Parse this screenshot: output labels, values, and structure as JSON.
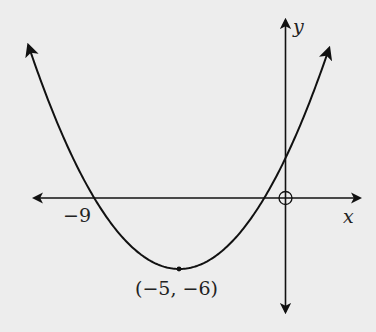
{
  "chart_data": {
    "type": "line",
    "title": "",
    "function": "y = 0.375(x + 5)^2 - 6",
    "xlabel": "x",
    "ylabel": "y",
    "vertex": {
      "x": -5,
      "y": -6,
      "label": "(−5, −6)"
    },
    "x_intercepts": [
      {
        "x": -9,
        "label": "−9"
      },
      {
        "x": -1,
        "label": ""
      }
    ],
    "y_intercept": {
      "x": 0,
      "y": 3.375
    },
    "origin_marker": "open-circle",
    "grid": false,
    "xlim": [
      -12.2,
      2.8
    ],
    "ylim": [
      -9.6,
      15.2
    ],
    "arrows": [
      "curve-left-end",
      "curve-right-end",
      "x-axis-both",
      "y-axis-both"
    ]
  },
  "labels": {
    "x_axis": "x",
    "y_axis": "y",
    "root_left": "−9",
    "vertex": "(−5, −6)"
  },
  "colors": {
    "background": "#ededed",
    "ink": "#111111"
  }
}
